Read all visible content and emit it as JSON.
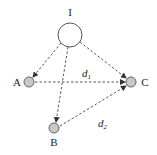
{
  "diagram": {
    "nodes": [
      {
        "id": "I",
        "label": "I",
        "cx": 70,
        "cy": 35,
        "r": 12,
        "fill": "#ffffff"
      },
      {
        "id": "A",
        "label": "A",
        "cx": 29,
        "cy": 82,
        "r": 5,
        "fill": "#c8c8c8"
      },
      {
        "id": "B",
        "label": "B",
        "cx": 54,
        "cy": 128,
        "r": 5,
        "fill": "#c8c8c8"
      },
      {
        "id": "C",
        "label": "C",
        "cx": 131,
        "cy": 82,
        "r": 5,
        "fill": "#c8c8c8"
      }
    ],
    "edges": [
      {
        "from": "I",
        "to": "A",
        "style": "dashed",
        "arrow": true
      },
      {
        "from": "I",
        "to": "B",
        "style": "dashed",
        "arrow": true
      },
      {
        "from": "I",
        "to": "C",
        "style": "dashed",
        "arrow": true
      },
      {
        "from": "A",
        "to": "C",
        "style": "dashed",
        "arrow": true,
        "label": "d1"
      },
      {
        "from": "B",
        "to": "C",
        "style": "dashed",
        "arrow": true,
        "label": "d2"
      }
    ],
    "edge_labels": {
      "d1": {
        "base": "d",
        "sub": "1"
      },
      "d2": {
        "base": "d",
        "sub": "2"
      }
    }
  }
}
